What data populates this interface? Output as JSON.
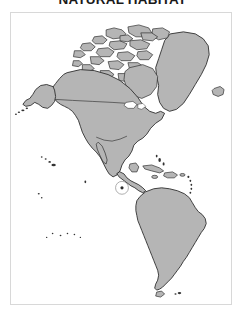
{
  "figure": {
    "title": "NATURAL HABITAT",
    "title_clipped_top": true
  },
  "map": {
    "name": "americas-habitat-map",
    "projection_region": "Americas (North, Central and South America)",
    "ocean_color": "#ffffff",
    "land_fill_color": "#b5b5b5",
    "land_outline_color": "#2e2e2e",
    "frame_color": "#d8d8d8",
    "marker_ring_color": "#9a9a9a",
    "marker_dot_color": "#2b2b2b",
    "regions": [
      {
        "id": "alaska",
        "label": "Alaska"
      },
      {
        "id": "canada",
        "label": "Canada"
      },
      {
        "id": "canadian-arctic-archipelago",
        "label": "Canadian Arctic Archipelago"
      },
      {
        "id": "greenland",
        "label": "Greenland"
      },
      {
        "id": "iceland",
        "label": "Iceland"
      },
      {
        "id": "united-states",
        "label": "United States"
      },
      {
        "id": "mexico",
        "label": "Mexico"
      },
      {
        "id": "central-america",
        "label": "Central America"
      },
      {
        "id": "cuba",
        "label": "Cuba"
      },
      {
        "id": "hispaniola",
        "label": "Hispaniola"
      },
      {
        "id": "jamaica",
        "label": "Jamaica"
      },
      {
        "id": "puerto-rico",
        "label": "Puerto Rico"
      },
      {
        "id": "lesser-antilles",
        "label": "Lesser Antilles"
      },
      {
        "id": "bahamas",
        "label": "Bahamas"
      },
      {
        "id": "south-america",
        "label": "South America"
      },
      {
        "id": "tierra-del-fuego",
        "label": "Tierra del Fuego"
      },
      {
        "id": "falkland-islands",
        "label": "Falkland Islands"
      },
      {
        "id": "hawaii",
        "label": "Hawaiian Islands"
      },
      {
        "id": "aleutian-islands",
        "label": "Aleutian Islands"
      },
      {
        "id": "baja-california",
        "label": "Baja California"
      }
    ],
    "highlight": {
      "id": "galapagos-islands",
      "label": "Galapagos Islands",
      "style": "circled marker",
      "position_note": "Pacific Ocean, west of Ecuador"
    },
    "internal_borders": [
      {
        "id": "usa-canada-border",
        "label": "United States – Canada border"
      },
      {
        "id": "usa-mexico-border",
        "label": "United States – Mexico border"
      }
    ]
  }
}
